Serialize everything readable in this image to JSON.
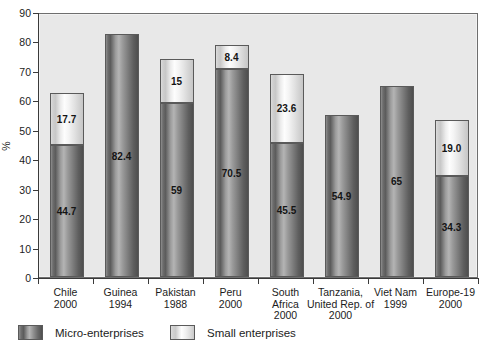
{
  "chart_data": {
    "type": "bar",
    "title": "",
    "subtitle": "",
    "xlabel": "",
    "ylabel": "%",
    "ylim": [
      0,
      90
    ],
    "ytick_step": 10,
    "yticks": [
      "0",
      "10",
      "20",
      "30",
      "40",
      "50",
      "60",
      "70",
      "80",
      "90"
    ],
    "grid": false,
    "stacked": true,
    "legend_position": "bottom",
    "categories": [
      "Chile\n2000",
      "Guinea\n1994",
      "Pakistan\n1988",
      "Peru\n2000",
      "South Africa\n2000",
      "Tanzania, United Rep. of\n2000",
      "Viet Nam\n1999",
      "Europe-19\n2000"
    ],
    "category_lines": [
      [
        "Chile",
        "2000"
      ],
      [
        "Guinea",
        "1994"
      ],
      [
        "Pakistan",
        "1988"
      ],
      [
        "Peru",
        "2000"
      ],
      [
        "South",
        "Africa",
        "2000"
      ],
      [
        "Tanzania,",
        "United Rep. of",
        "2000"
      ],
      [
        "Viet Nam",
        "1999"
      ],
      [
        "Europe-19",
        "2000"
      ]
    ],
    "series": [
      {
        "name": "Micro-enterprises",
        "color": "#6d6d6d",
        "values": [
          44.7,
          82.4,
          59,
          70.5,
          45.5,
          54.9,
          65,
          34.3
        ],
        "labels": [
          "44.7",
          "82.4",
          "59",
          "70.5",
          "45.5",
          "54.9",
          "65",
          "34.3"
        ]
      },
      {
        "name": "Small enterprises",
        "color": "#f2f2f2",
        "values": [
          17.7,
          0,
          15,
          8.4,
          23.6,
          0,
          0,
          19.0
        ],
        "labels": [
          "17.7",
          "",
          "15",
          "8.4",
          "23.6",
          "",
          "",
          "19.0"
        ]
      }
    ],
    "totals": [
      62.4,
      82.4,
      74,
      78.9,
      69.1,
      54.9,
      65,
      53.3
    ]
  },
  "legend": {
    "items": [
      {
        "label": "Micro-enterprises",
        "swatch": "micro"
      },
      {
        "label": "Small enterprises",
        "swatch": "small"
      }
    ]
  },
  "colors": {
    "plot_background": "#e8e8e8",
    "axis": "#3a3a3a",
    "text": "#1c1c1c",
    "micro_fill": "#6d6d6d",
    "small_fill": "#f2f2f2",
    "bar_border": "#5a5a5a"
  }
}
